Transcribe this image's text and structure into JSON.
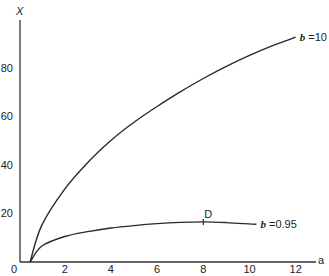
{
  "chart_data": {
    "type": "line",
    "title": "",
    "xlabel": "a",
    "ylabel": "X",
    "xlim": [
      0,
      13
    ],
    "ylim": [
      0,
      100
    ],
    "grid": false,
    "x_ticks": [
      "0",
      "2",
      "4",
      "6",
      "8",
      "10",
      "12"
    ],
    "y_ticks": [
      "20",
      "40",
      "60",
      "80"
    ],
    "series": [
      {
        "name": "b = 10",
        "label_prefix": "b",
        "label_value": "=10",
        "x": [
          0.5,
          1,
          2,
          3,
          4,
          5,
          6,
          7,
          8,
          9,
          10,
          11,
          12
        ],
        "y": [
          0,
          15,
          30,
          41,
          50,
          57.5,
          64,
          70,
          75.5,
          80.5,
          85,
          89,
          92.5
        ]
      },
      {
        "name": "b = 0.95",
        "label_prefix": "b",
        "label_value": "=0.95",
        "x": [
          0.5,
          1,
          2,
          3,
          4,
          5,
          6,
          7,
          8,
          9,
          10.3
        ],
        "y": [
          0,
          6.5,
          10.5,
          12.5,
          14,
          15,
          15.8,
          16.3,
          16.5,
          16.2,
          15.5
        ]
      }
    ],
    "annotations": [
      {
        "text": "D",
        "x": 8,
        "y": 16.5,
        "series": "b = 0.95",
        "marker": "tick"
      }
    ]
  }
}
